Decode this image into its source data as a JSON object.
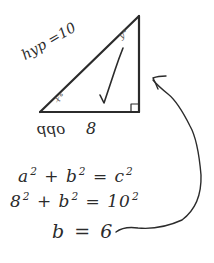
{
  "diagram": {
    "type": "right-triangle-sketch",
    "style": "handwritten",
    "ink_color": "#2b2b2b",
    "background": "#ffffff",
    "triangle": {
      "hypotenuse_label": "hyp =10",
      "bottom_side_label": "opp",
      "bottom_side_value": "8",
      "angle_top": "y°",
      "angle_bottom_left": "x°",
      "right_angle_marker": "bottom-right",
      "check_mark": true
    },
    "arrow": {
      "from": "b = 6",
      "to": "right side of triangle"
    },
    "equations": [
      {
        "base1": "a",
        "exp1": "2",
        "op": "+",
        "base2": "b",
        "exp2": "2",
        "eq": "=",
        "rhs_base": "c",
        "rhs_exp": "2"
      },
      {
        "base1": "8",
        "exp1": "2",
        "op": "+",
        "base2": "b",
        "exp2": "2",
        "eq": "=",
        "rhs_base": "10",
        "rhs_exp": "2"
      }
    ],
    "result": "b = 6"
  }
}
